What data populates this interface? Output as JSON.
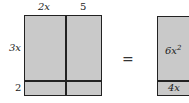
{
  "left_grid": {
    "top_labels": [
      "2x",
      "5"
    ],
    "side_labels": [
      "3x",
      "2"
    ],
    "fill_color": "#c9c9c9",
    "line_color": "#222222"
  },
  "operator": "=",
  "right_box": {
    "cells": [
      {
        "coef": "6x",
        "exp": "2"
      },
      {
        "text": "4x"
      }
    ],
    "fill_color": "#c9c9c9"
  }
}
